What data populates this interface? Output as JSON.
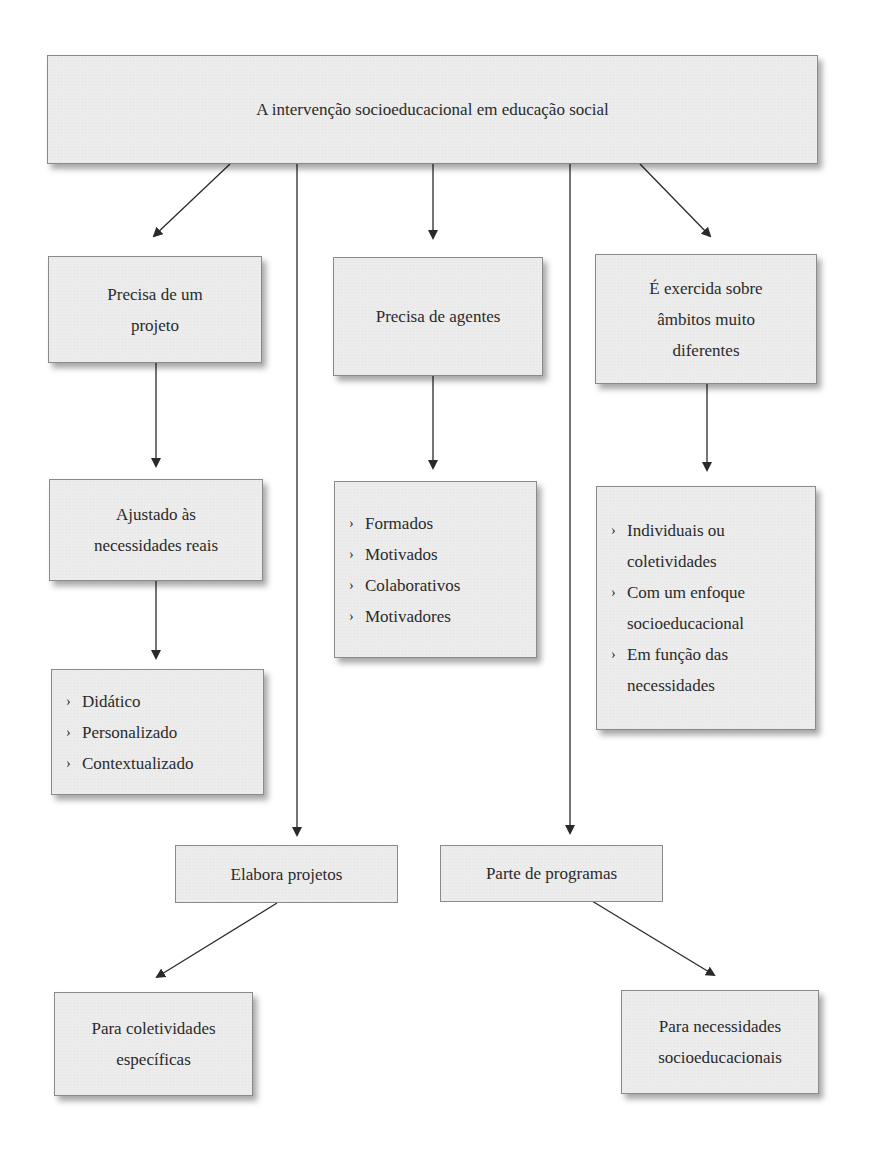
{
  "diagram": {
    "type": "concept-map",
    "root": {
      "id": "root",
      "label": "A intervenção socioeducacional em educação social"
    },
    "nodes": {
      "projeto": {
        "id": "projeto",
        "lines": [
          "Precisa de um",
          "projeto"
        ]
      },
      "agentes": {
        "id": "agentes",
        "lines": [
          "Precisa de agentes"
        ]
      },
      "ambitos": {
        "id": "ambitos",
        "lines": [
          "É exercida sobre",
          "âmbitos muito",
          "diferentes"
        ]
      },
      "ajustado": {
        "id": "ajustado",
        "lines": [
          "Ajustado às",
          "necessidades reais"
        ]
      },
      "agentes_list": {
        "id": "agentes_list",
        "bullet": "›",
        "items": [
          "Formados",
          "Motivados",
          "Colaborativos",
          "Motivadores"
        ]
      },
      "ambitos_list": {
        "id": "ambitos_list",
        "bullet": "›",
        "items": [
          [
            "Individuais ou",
            "coletividades"
          ],
          [
            "Com um enfoque",
            "socioeducacional"
          ],
          [
            "Em função das",
            "necessidades"
          ]
        ]
      },
      "projeto_list": {
        "id": "projeto_list",
        "bullet": "›",
        "items": [
          "Didático",
          "Personalizado",
          "Contextualizado"
        ]
      },
      "elabora": {
        "id": "elabora",
        "lines": [
          "Elabora projetos"
        ]
      },
      "parte": {
        "id": "parte",
        "lines": [
          "Parte de programas"
        ]
      },
      "coletividades": {
        "id": "coletividades",
        "lines": [
          "Para coletividades",
          "específicas"
        ]
      },
      "necessidades": {
        "id": "necessidades",
        "lines": [
          "Para necessidades",
          "socioeducacionais"
        ]
      }
    },
    "edges": [
      {
        "from": "root",
        "to": "projeto"
      },
      {
        "from": "root",
        "to": "agentes"
      },
      {
        "from": "root",
        "to": "ambitos"
      },
      {
        "from": "root",
        "to": "elabora"
      },
      {
        "from": "root",
        "to": "parte"
      },
      {
        "from": "projeto",
        "to": "ajustado"
      },
      {
        "from": "ajustado",
        "to": "projeto_list"
      },
      {
        "from": "agentes",
        "to": "agentes_list"
      },
      {
        "from": "ambitos",
        "to": "ambitos_list"
      },
      {
        "from": "elabora",
        "to": "coletividades"
      },
      {
        "from": "parte",
        "to": "necessidades"
      }
    ],
    "colors": {
      "box_fill": "#ececec",
      "box_border": "#8a8a8a",
      "arrow": "#2a2a2a",
      "text": "#2a2a2a"
    }
  }
}
